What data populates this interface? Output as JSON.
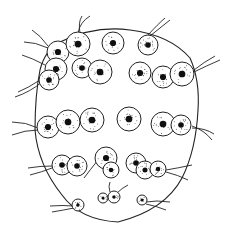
{
  "image": {
    "description": "Hand-drawn line illustration of a colony of round cells with dark speckled nuclei and flagella, enclosed by an outer boundary",
    "width": 235,
    "height": 237,
    "stroke_color": "#222222",
    "nucleus_color": "#111111",
    "background": "#ffffff"
  },
  "cells": [
    {
      "cx": 58,
      "cy": 52,
      "r": 11
    },
    {
      "cx": 78,
      "cy": 44,
      "r": 12
    },
    {
      "cx": 113,
      "cy": 43,
      "r": 11
    },
    {
      "cx": 148,
      "cy": 45,
      "r": 10
    },
    {
      "cx": 56,
      "cy": 69,
      "r": 11
    },
    {
      "cx": 49,
      "cy": 80,
      "r": 10
    },
    {
      "cx": 82,
      "cy": 68,
      "r": 10
    },
    {
      "cx": 100,
      "cy": 72,
      "r": 12
    },
    {
      "cx": 140,
      "cy": 73,
      "r": 11
    },
    {
      "cx": 163,
      "cy": 77,
      "r": 11
    },
    {
      "cx": 182,
      "cy": 74,
      "r": 12
    },
    {
      "cx": 48,
      "cy": 127,
      "r": 11
    },
    {
      "cx": 68,
      "cy": 122,
      "r": 12
    },
    {
      "cx": 92,
      "cy": 120,
      "r": 12
    },
    {
      "cx": 129,
      "cy": 119,
      "r": 12
    },
    {
      "cx": 163,
      "cy": 124,
      "r": 12
    },
    {
      "cx": 181,
      "cy": 125,
      "r": 10
    },
    {
      "cx": 62,
      "cy": 165,
      "r": 10
    },
    {
      "cx": 77,
      "cy": 166,
      "r": 10
    },
    {
      "cx": 106,
      "cy": 158,
      "r": 11
    },
    {
      "cx": 111,
      "cy": 170,
      "r": 8
    },
    {
      "cx": 136,
      "cy": 163,
      "r": 10
    },
    {
      "cx": 145,
      "cy": 170,
      "r": 9
    },
    {
      "cx": 158,
      "cy": 169,
      "r": 8
    },
    {
      "cx": 103,
      "cy": 198,
      "r": 5
    },
    {
      "cx": 114,
      "cy": 197,
      "r": 6
    },
    {
      "cx": 78,
      "cy": 205,
      "r": 6
    },
    {
      "cx": 142,
      "cy": 200,
      "r": 5
    }
  ],
  "flagella": [
    "M78,33 Q80,22 90,16",
    "M80,33 Q78,22 82,16",
    "M148,35 Q158,24 165,18",
    "M150,36 Q160,28 170,20",
    "M48,46 Q40,35 32,30",
    "M48,48 Q35,42 24,42",
    "M45,65 Q32,58 22,55",
    "M40,80 Q28,88 18,92",
    "M42,82 Q30,92 15,97",
    "M194,70 Q204,62 215,56",
    "M194,72 Q206,66 220,60",
    "M38,130 Q25,130 12,135",
    "M38,128 Q26,122 12,122",
    "M192,128 Q205,128 214,134",
    "M192,126 Q204,130 212,140",
    "M52,168 Q42,172 30,175",
    "M52,166 Q40,166 28,168",
    "M98,160 Q90,170 84,178",
    "M166,170 Q178,168 192,165",
    "M166,172 Q178,175 188,180",
    "M117,193 Q122,188 128,185",
    "M110,192 Q108,186 110,182",
    "M74,208 Q64,210 52,212",
    "M74,206 Q62,205 50,206",
    "M146,202 Q156,200 170,202",
    "M146,204 Q156,206 166,210"
  ],
  "boundary": "M60,42 Q95,25 130,30 Q170,35 190,58 Q200,80 198,110 Q196,150 182,178 Q165,210 118,222 Q80,220 62,195 Q38,165 35,130 Q35,95 40,70 Q45,50 60,42 Z"
}
